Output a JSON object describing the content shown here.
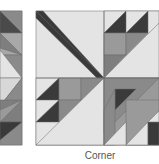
{
  "caption": "Corner",
  "colors": {
    "light": "#e4e4e4",
    "medium": "#9a9a9a",
    "mediumdark": "#7e7e7e",
    "dark": "#4a4a4a",
    "darkest": "#3a3a3a",
    "outline": "#6a6a6a"
  },
  "blocks": [
    {
      "name": "partial-left-block",
      "visible_portion": "right edge"
    },
    {
      "name": "corner-block",
      "label": "Corner"
    }
  ]
}
